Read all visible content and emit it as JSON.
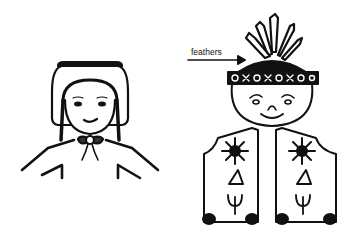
{
  "figure": {
    "left_figure": {
      "name": "girl-with-bonnet",
      "parts": [
        "bonnet",
        "face",
        "eyes",
        "smile",
        "braids",
        "collar-brooch",
        "shoulders"
      ]
    },
    "right_figure": {
      "name": "figure-with-feather-headdress-and-vest",
      "parts": [
        "feathers",
        "headband",
        "face",
        "eyes",
        "nose",
        "smile",
        "vest",
        "sun-symbols",
        "triangle-symbols",
        "plant-symbols"
      ]
    },
    "annotations": [
      {
        "label": "feathers"
      }
    ],
    "colors": {
      "ink": "#111111",
      "background": "#ffffff"
    }
  }
}
